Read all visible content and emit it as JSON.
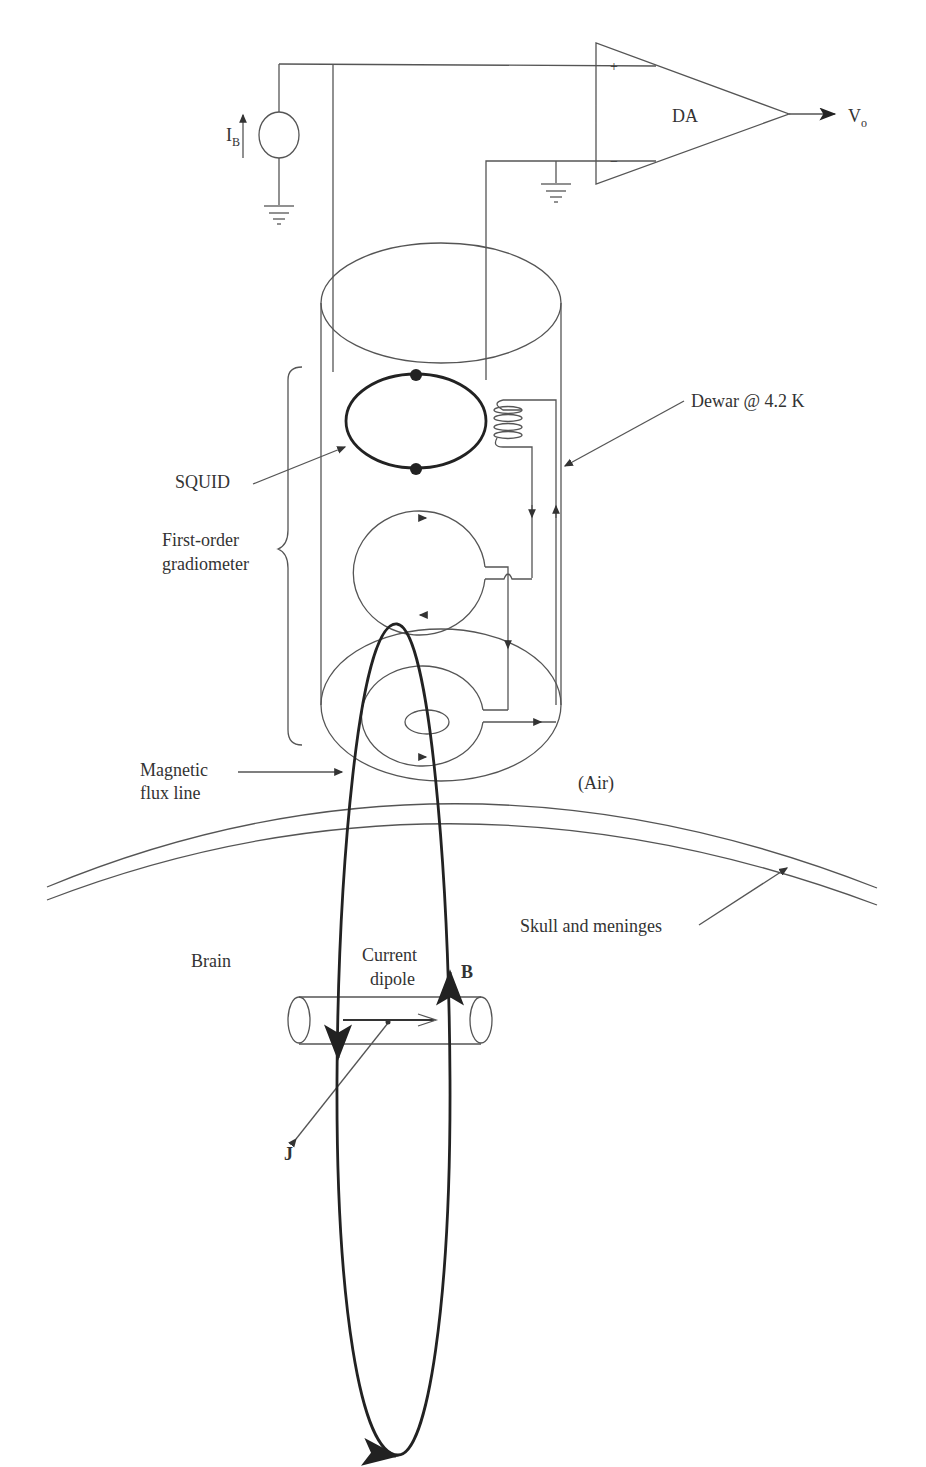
{
  "diagram": {
    "type": "schematic",
    "labels": {
      "bias_current": "I",
      "bias_current_sub": "B",
      "amplifier": "DA",
      "amp_plus": "+",
      "amp_minus": "−",
      "output": "V",
      "output_sub": "o",
      "dewar": "Dewar @ 4.2 K",
      "squid": "SQUID",
      "gradiometer_line1": "First-order",
      "gradiometer_line2": "gradiometer",
      "flux_line1": "Magnetic",
      "flux_line2": "flux line",
      "air": "(Air)",
      "skull": "Skull and meninges",
      "brain": "Brain",
      "dipole_line1": "Current",
      "dipole_line2": "dipole",
      "field": "B",
      "current_density": "J"
    },
    "components": [
      "current-source",
      "ground-symbol",
      "differential-amplifier",
      "dewar-cylinder",
      "squid-ring-with-josephson-junctions",
      "coupling-coil",
      "gradiometer-upper-loop",
      "gradiometer-pickup-loop",
      "magnetic-flux-loop",
      "skull-layers",
      "current-dipole-cylinder"
    ],
    "colors": {
      "line": "#555555",
      "heavy_line": "#222222",
      "text": "#333333",
      "background": "#ffffff"
    }
  }
}
